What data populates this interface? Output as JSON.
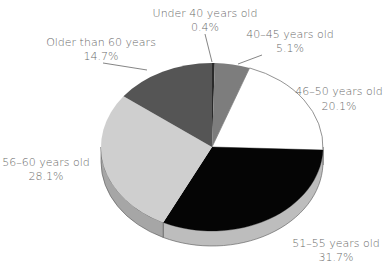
{
  "chart_data": {
    "type": "pie",
    "style": "3d",
    "title": "",
    "categories": [
      "Under 40 years old",
      "40–45 years old",
      "46–50 years old",
      "51–55 years old",
      "56–60 years old",
      "Older than 60 years"
    ],
    "values": [
      0.4,
      5.1,
      20.1,
      31.7,
      28.1,
      14.7
    ],
    "value_labels": [
      "0.4%",
      "5.1%",
      "20.1%",
      "31.7%",
      "28.1%",
      "14.7%"
    ],
    "colors": [
      "#2a2a2a",
      "#7d7d7d",
      "#ffffff",
      "#050505",
      "#cfcfcf",
      "#555555"
    ],
    "legend": "none (direct labels)"
  },
  "labels": [
    {
      "name": "Under 40 years old",
      "pct": "0.4%"
    },
    {
      "name": "40–45 years old",
      "pct": "5.1%"
    },
    {
      "name": "46–50 years old",
      "pct": "20.1%"
    },
    {
      "name": "51–55 years old",
      "pct": "31.7%"
    },
    {
      "name": "56–60 years old",
      "pct": "28.1%"
    },
    {
      "name": "Older than 60 years",
      "pct": "14.7%"
    }
  ]
}
